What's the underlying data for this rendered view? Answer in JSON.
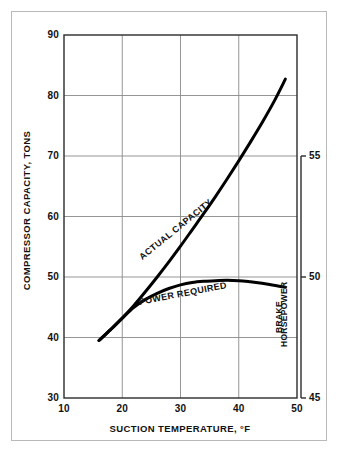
{
  "chart_data": {
    "type": "line",
    "title": "",
    "xlabel": "SUCTION TEMPERATURE, °F",
    "ylabel": "COMPRESSOR CAPACITY, TONS",
    "y2label_line1": "BRAKE",
    "y2label_line2": "HORSEPOWER",
    "xlim": [
      10,
      50
    ],
    "ylim": [
      30,
      90
    ],
    "y2lim": [
      45,
      60
    ],
    "xticks": [
      "10",
      "20",
      "30",
      "40",
      "50"
    ],
    "xtick_values": [
      10,
      20,
      30,
      40,
      50
    ],
    "yticks": [
      "30",
      "40",
      "50",
      "60",
      "70",
      "80",
      "90"
    ],
    "ytick_values": [
      30,
      40,
      50,
      60,
      70,
      80,
      90
    ],
    "y2ticks": [
      "45",
      "50",
      "55"
    ],
    "y2tick_values": [
      45,
      50,
      55
    ],
    "grid": true,
    "grid_color": "#8a8a8a",
    "line_color": "#000000",
    "legend_position": "inline-annotations",
    "series": [
      {
        "name": "ACTUAL CAPACITY",
        "axis": "left",
        "label_x": 29.5,
        "label_y": 57.5,
        "label_rotation": -39,
        "x": [
          16.0,
          18.0,
          20.0,
          22.0,
          24.0,
          26.0,
          28.0,
          30.0,
          32.0,
          34.0,
          36.0,
          38.0,
          40.0,
          42.0,
          44.0,
          46.0,
          48.0
        ],
        "y": [
          39.5,
          41.3,
          43.2,
          45.3,
          47.6,
          50.0,
          52.5,
          55.1,
          57.8,
          60.5,
          63.3,
          66.2,
          69.2,
          72.3,
          75.5,
          78.9,
          82.7
        ]
      },
      {
        "name": "POWER REQUIRED",
        "axis": "right",
        "label_x": 30.5,
        "label_y": 46.8,
        "label_rotation": -11,
        "x": [
          16.0,
          18.0,
          20.0,
          22.0,
          24.0,
          26.0,
          28.0,
          30.0,
          32.0,
          34.0,
          36.0,
          38.0,
          40.0,
          42.0,
          44.0,
          46.0,
          48.0
        ],
        "y": [
          39.5,
          41.3,
          43.2,
          45.0,
          46.3,
          47.3,
          48.1,
          48.7,
          49.1,
          49.3,
          49.4,
          49.45,
          49.4,
          49.2,
          48.95,
          48.65,
          48.3
        ],
        "y_bhp": [
          50.0,
          50.45,
          50.9,
          51.35,
          51.7,
          51.95,
          52.15,
          52.3,
          52.4,
          52.45,
          52.5,
          52.5,
          52.5,
          52.45,
          52.35,
          52.25,
          52.15
        ]
      }
    ]
  },
  "axes": {
    "left_title": "COMPRESSOR CAPACITY, TONS",
    "bottom_title": "SUCTION TEMPERATURE, °F",
    "right_title_line1": "BRAKE",
    "right_title_line2": "HORSEPOWER"
  },
  "annotations": {
    "actual_capacity": "ACTUAL CAPACITY",
    "power_required": "POWER REQUIRED"
  },
  "ticks": {
    "x": [
      "10",
      "20",
      "30",
      "40",
      "50"
    ],
    "y": [
      "30",
      "40",
      "50",
      "60",
      "70",
      "80",
      "90"
    ],
    "y2": [
      "45",
      "50",
      "55"
    ]
  }
}
